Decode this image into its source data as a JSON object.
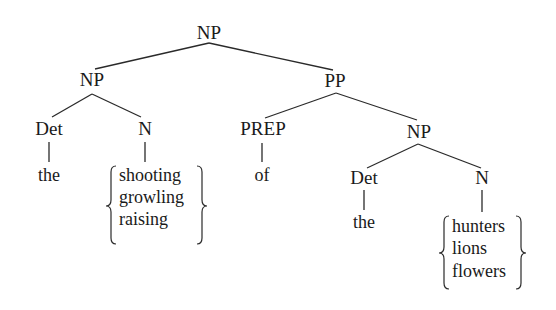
{
  "tree": {
    "root": {
      "label": "NP"
    },
    "np_left": {
      "label": "NP"
    },
    "det_left": {
      "label": "Det",
      "word": "the"
    },
    "n_left": {
      "label": "N",
      "alternatives": [
        "shooting",
        "growling",
        "raising"
      ]
    },
    "pp": {
      "label": "PP"
    },
    "prep": {
      "label": "PREP",
      "word": "of"
    },
    "np_right": {
      "label": "NP"
    },
    "det_right": {
      "label": "Det",
      "word": "the"
    },
    "n_right": {
      "label": "N",
      "alternatives": [
        "hunters",
        "lions",
        "flowers"
      ]
    }
  },
  "colors": {
    "ink": "#1a1a1a",
    "background": "#ffffff"
  }
}
